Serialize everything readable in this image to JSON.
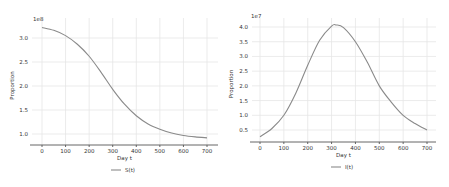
{
  "chart_data": [
    {
      "type": "line",
      "title": "",
      "xlabel": "Day t",
      "ylabel": "Proportion",
      "y_offset_label": "1e8",
      "xlim": [
        -20,
        720
      ],
      "ylim": [
        0.8,
        3.3
      ],
      "xticks": [
        "0",
        "100",
        "200",
        "300",
        "400",
        "500",
        "600",
        "700"
      ],
      "yticks": [
        "1.0",
        "1.5",
        "2.0",
        "2.5",
        "3.0"
      ],
      "grid": true,
      "legend_position": "bottom-center",
      "series": [
        {
          "name": "S(t)",
          "x": [
            0,
            50,
            100,
            150,
            200,
            250,
            300,
            350,
            400,
            450,
            500,
            550,
            600,
            650,
            700
          ],
          "values": [
            3.22,
            3.16,
            3.05,
            2.87,
            2.62,
            2.29,
            1.93,
            1.62,
            1.38,
            1.21,
            1.1,
            1.02,
            0.97,
            0.94,
            0.92
          ]
        }
      ]
    },
    {
      "type": "line",
      "title": "",
      "xlabel": "Day t",
      "ylabel": "Proportion",
      "y_offset_label": "1e7",
      "xlim": [
        -20,
        720
      ],
      "ylim": [
        0.1,
        4.2
      ],
      "xticks": [
        "0",
        "100",
        "200",
        "300",
        "400",
        "500",
        "600",
        "700"
      ],
      "yticks": [
        "0.5",
        "1.0",
        "1.5",
        "2.0",
        "2.5",
        "3.0",
        "3.5",
        "4.0"
      ],
      "grid": true,
      "legend_position": "bottom-center",
      "series": [
        {
          "name": "I(t)",
          "x": [
            0,
            50,
            100,
            150,
            200,
            250,
            300,
            320,
            350,
            400,
            450,
            500,
            550,
            600,
            650,
            700
          ],
          "values": [
            0.27,
            0.55,
            1.0,
            1.75,
            2.7,
            3.55,
            4.03,
            4.07,
            3.98,
            3.5,
            2.8,
            2.0,
            1.45,
            1.0,
            0.72,
            0.5
          ]
        }
      ]
    }
  ],
  "left": {
    "legend": "S(t)",
    "xlabel": "Day t",
    "ylabel": "Proportion",
    "offset": "1e8"
  },
  "right": {
    "legend": "I(t)",
    "xlabel": "Day t",
    "ylabel": "Proportion",
    "offset": "1e7"
  }
}
